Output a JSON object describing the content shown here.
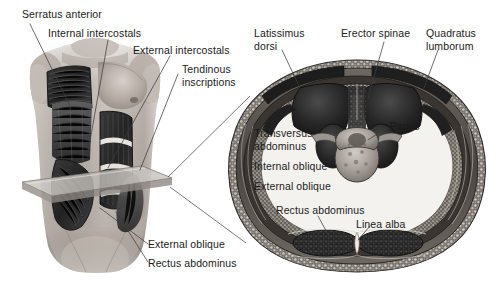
{
  "figure": {
    "background_color": "#ffffff",
    "text_color": "#1a1a1a",
    "leader_line_color": "#3c3c3c",
    "width": 499,
    "height": 282
  },
  "panels": {
    "left": {
      "name": "anterior-torso-view",
      "description": "Anterior view of male torso with superficial and deep trunk muscles dissected, showing a transparent transverse cutting plane at the level of the lower abdomen"
    },
    "right": {
      "name": "transverse-section-view",
      "description": "Magnified transverse (cross) section of the abdomen at the level indicated by the cutting plane, showing vertebra, erector spinae, psoas and the layered abdominal wall"
    }
  },
  "labels": {
    "serratus_anterior": "Serratus anterior",
    "internal_intercostals": "Internal intercostals",
    "external_intercostals": "External intercostals",
    "tendinous_inscriptions": "Tendinous\ninscriptions",
    "external_oblique_left": "External oblique",
    "rectus_abdominus_left": "Rectus abdominus",
    "latissimus_dorsi": "Latissimus\ndorsi",
    "erector_spinae": "Erector spinae",
    "quadratus_lumborum": "Quadratus\nlumborum",
    "psoas": "Psoas",
    "transversus_abdominus": "Transversus\nabdominus",
    "internal_oblique": "Internal oblique",
    "external_oblique_right": "External oblique",
    "rectus_abdominus_right": "Rectus abdominus",
    "linea_alba": "Linea alba"
  },
  "colors": {
    "muscle_dark": "#2b2b2b",
    "muscle_mid": "#565656",
    "skin_light": "#cfc9c4",
    "skin_mid": "#a89f99",
    "plane_fill": "#b9b4ae",
    "bone_light": "#b5b0aa",
    "section_fat": "#8d8782"
  }
}
